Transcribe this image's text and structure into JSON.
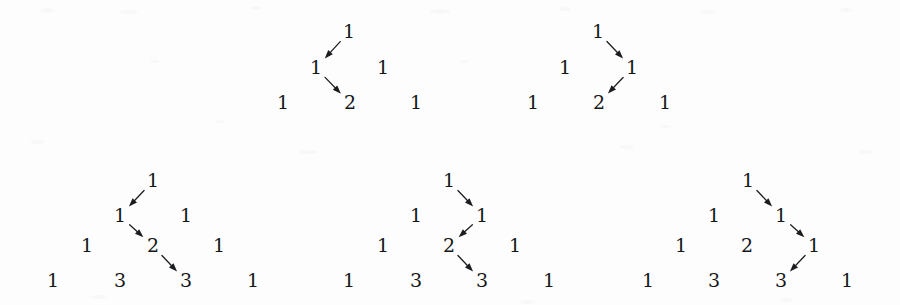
{
  "figure": {
    "background_color": "#fdfdfd",
    "ink_color": "#15171a",
    "digit_font_size_px": 19,
    "arrow_color": "#1a1c1f"
  },
  "diagrams": [
    {
      "id": "top-left",
      "rows": 3,
      "nodes": [
        {
          "id": "n0_0",
          "value": "1",
          "x": 349,
          "y": 32
        },
        {
          "id": "n1_0",
          "value": "1",
          "x": 316,
          "y": 68
        },
        {
          "id": "n1_1",
          "value": "1",
          "x": 383,
          "y": 68
        },
        {
          "id": "n2_0",
          "value": "1",
          "x": 283,
          "y": 103
        },
        {
          "id": "n2_1",
          "value": "2",
          "x": 350,
          "y": 103
        },
        {
          "id": "n2_2",
          "value": "1",
          "x": 416,
          "y": 103
        }
      ],
      "arrows": [
        {
          "from": "n0_0",
          "to": "n1_0",
          "direction": "down-left"
        },
        {
          "from": "n1_0",
          "to": "n2_1",
          "direction": "down-right"
        }
      ]
    },
    {
      "id": "top-right",
      "rows": 3,
      "nodes": [
        {
          "id": "n0_0",
          "value": "1",
          "x": 598,
          "y": 32
        },
        {
          "id": "n1_0",
          "value": "1",
          "x": 565,
          "y": 68
        },
        {
          "id": "n1_1",
          "value": "1",
          "x": 632,
          "y": 68
        },
        {
          "id": "n2_0",
          "value": "1",
          "x": 533,
          "y": 103
        },
        {
          "id": "n2_1",
          "value": "2",
          "x": 599,
          "y": 103
        },
        {
          "id": "n2_2",
          "value": "1",
          "x": 665,
          "y": 103
        }
      ],
      "arrows": [
        {
          "from": "n0_0",
          "to": "n1_1",
          "direction": "down-right"
        },
        {
          "from": "n1_1",
          "to": "n2_1",
          "direction": "down-left"
        }
      ]
    },
    {
      "id": "bottom-left",
      "rows": 4,
      "nodes": [
        {
          "id": "n0_0",
          "value": "1",
          "x": 153,
          "y": 181
        },
        {
          "id": "n1_0",
          "value": "1",
          "x": 120,
          "y": 216
        },
        {
          "id": "n1_1",
          "value": "1",
          "x": 186,
          "y": 216
        },
        {
          "id": "n2_0",
          "value": "1",
          "x": 87,
          "y": 246
        },
        {
          "id": "n2_1",
          "value": "2",
          "x": 153,
          "y": 246
        },
        {
          "id": "n2_2",
          "value": "1",
          "x": 219,
          "y": 246
        },
        {
          "id": "n3_0",
          "value": "1",
          "x": 53,
          "y": 281
        },
        {
          "id": "n3_1",
          "value": "3",
          "x": 120,
          "y": 281
        },
        {
          "id": "n3_2",
          "value": "3",
          "x": 186,
          "y": 281
        },
        {
          "id": "n3_3",
          "value": "1",
          "x": 253,
          "y": 281
        }
      ],
      "arrows": [
        {
          "from": "n0_0",
          "to": "n1_0",
          "direction": "down-left"
        },
        {
          "from": "n1_0",
          "to": "n2_1",
          "direction": "down-right"
        },
        {
          "from": "n2_1",
          "to": "n3_2",
          "direction": "down-right"
        }
      ]
    },
    {
      "id": "bottom-middle",
      "rows": 4,
      "nodes": [
        {
          "id": "n0_0",
          "value": "1",
          "x": 449,
          "y": 181
        },
        {
          "id": "n1_0",
          "value": "1",
          "x": 416,
          "y": 216
        },
        {
          "id": "n1_1",
          "value": "1",
          "x": 482,
          "y": 216
        },
        {
          "id": "n2_0",
          "value": "1",
          "x": 383,
          "y": 246
        },
        {
          "id": "n2_1",
          "value": "2",
          "x": 449,
          "y": 246
        },
        {
          "id": "n2_2",
          "value": "1",
          "x": 515,
          "y": 246
        },
        {
          "id": "n3_0",
          "value": "1",
          "x": 349,
          "y": 281
        },
        {
          "id": "n3_1",
          "value": "3",
          "x": 416,
          "y": 281
        },
        {
          "id": "n3_2",
          "value": "3",
          "x": 482,
          "y": 281
        },
        {
          "id": "n3_3",
          "value": "1",
          "x": 549,
          "y": 281
        }
      ],
      "arrows": [
        {
          "from": "n0_0",
          "to": "n1_1",
          "direction": "down-right"
        },
        {
          "from": "n1_1",
          "to": "n2_1",
          "direction": "down-left"
        },
        {
          "from": "n2_1",
          "to": "n3_2",
          "direction": "down-right"
        }
      ]
    },
    {
      "id": "bottom-right",
      "rows": 4,
      "nodes": [
        {
          "id": "n0_0",
          "value": "1",
          "x": 748,
          "y": 181
        },
        {
          "id": "n1_0",
          "value": "1",
          "x": 714,
          "y": 216
        },
        {
          "id": "n1_1",
          "value": "1",
          "x": 781,
          "y": 216
        },
        {
          "id": "n2_0",
          "value": "1",
          "x": 681,
          "y": 246
        },
        {
          "id": "n2_1",
          "value": "2",
          "x": 747,
          "y": 246
        },
        {
          "id": "n2_2",
          "value": "1",
          "x": 814,
          "y": 246
        },
        {
          "id": "n3_0",
          "value": "1",
          "x": 648,
          "y": 281
        },
        {
          "id": "n3_1",
          "value": "3",
          "x": 714,
          "y": 281
        },
        {
          "id": "n3_2",
          "value": "3",
          "x": 781,
          "y": 281
        },
        {
          "id": "n3_3",
          "value": "1",
          "x": 847,
          "y": 281
        }
      ],
      "arrows": [
        {
          "from": "n0_0",
          "to": "n1_1",
          "direction": "down-right"
        },
        {
          "from": "n1_1",
          "to": "n2_2",
          "direction": "down-right"
        },
        {
          "from": "n2_2",
          "to": "n3_2",
          "direction": "down-left"
        }
      ]
    }
  ]
}
